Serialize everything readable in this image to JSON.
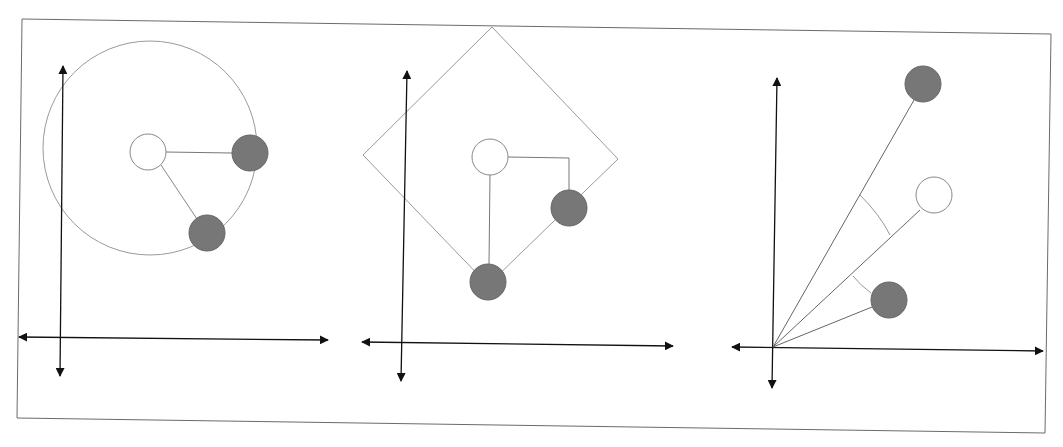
{
  "diagram": {
    "colors": {
      "query_fill": "#ffffff",
      "neighbor_fill": "#777777",
      "outline": "#8a8a8a",
      "axis": "#111111",
      "frame": "#6b6b6b"
    },
    "panels": [
      {
        "name": "euclidean",
        "boundary_shape": "circle",
        "query_point": "white",
        "neighbors": 2,
        "connector": "straight-line"
      },
      {
        "name": "manhattan",
        "boundary_shape": "diamond",
        "query_point": "white",
        "neighbors": 2,
        "connector": "right-angle-path"
      },
      {
        "name": "cosine",
        "boundary_shape": "rays-from-origin",
        "query_point": "white",
        "neighbors": 2,
        "connector": "angle-arc"
      }
    ]
  }
}
